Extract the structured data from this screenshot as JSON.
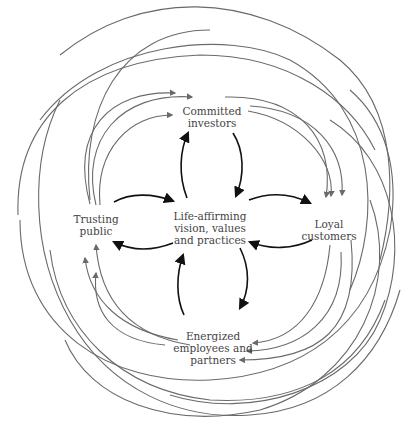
{
  "nodes": {
    "center": {
      "lines": [
        "Life-affirming",
        "vision, values",
        "and practices"
      ],
      "x": 210,
      "y": 228
    },
    "top": {
      "lines": [
        "Committed",
        "investors"
      ],
      "x": 212,
      "y": 117
    },
    "right": {
      "lines": [
        "Loyal",
        "customers"
      ],
      "x": 329,
      "y": 230
    },
    "bottom": {
      "lines": [
        "Energized",
        "employees and",
        "partners"
      ],
      "x": 213,
      "y": 348
    },
    "left": {
      "lines": [
        "Trusting",
        "public"
      ],
      "x": 96,
      "y": 225
    }
  },
  "colors": {
    "background": "#ffffff",
    "inner_arrows": "#111111",
    "outer_arrows": "#6a6a6a",
    "text": "#444444"
  },
  "edges": {
    "inner": [
      "center -> top",
      "top -> center",
      "center -> right",
      "right -> center",
      "center -> bottom",
      "bottom -> center",
      "center -> left",
      "left -> center"
    ],
    "outer": [
      "left -> top (x3)",
      "top -> right (x3)",
      "right -> bottom (x3)",
      "bottom -> left (x3)"
    ]
  }
}
